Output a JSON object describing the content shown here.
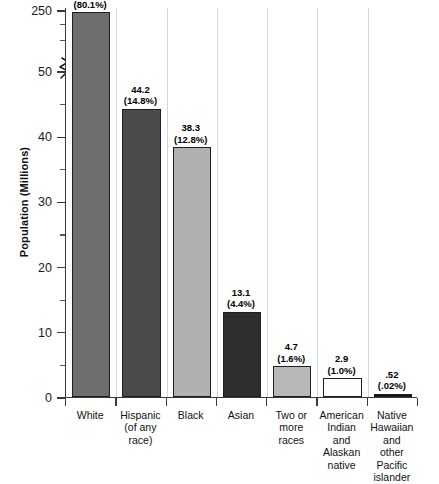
{
  "chart_data": {
    "type": "bar",
    "title": "",
    "xlabel": "",
    "ylabel": "Population (Millions)",
    "ylim": [
      0,
      250
    ],
    "axis_break": {
      "present": true,
      "below": 50,
      "above": 250
    },
    "grid": "vertical category separators only",
    "legend": "none",
    "categories": [
      "White",
      "Hispanic (of any race)",
      "Black",
      "Asian",
      "Two or more races",
      "American Indian and Alaskan native",
      "Native Hawaiian and other Pacific islander"
    ],
    "values": [
      239.9,
      44.2,
      38.3,
      13.1,
      4.7,
      2.9,
      0.52
    ],
    "percents": [
      "80.1%",
      "14.8%",
      "12.8%",
      "4.4%",
      "1.6%",
      "1.0%",
      ".02%"
    ],
    "y_major_ticks": [
      0,
      10,
      20,
      30,
      40,
      50,
      250
    ],
    "y_minor_ticks": [
      5,
      15,
      25,
      35,
      45
    ]
  },
  "axis": {
    "y_title": "Population (Millions)",
    "tick_labels": {
      "t0": "0",
      "t10": "10",
      "t20": "20",
      "t30": "30",
      "t40": "40",
      "t50": "50",
      "t250": "250"
    }
  },
  "bars": [
    {
      "name": "white",
      "value_label": "239.9",
      "percent_label": "(80.1%)",
      "category_line1": "White",
      "category_line2": "",
      "category_line3": "",
      "category_line4": "",
      "category_line5": "",
      "color": "#6e6e6e"
    },
    {
      "name": "hispanic",
      "value_label": "44.2",
      "percent_label": "(14.8%)",
      "category_line1": "Hispanic",
      "category_line2": "(of any race)",
      "category_line3": "",
      "category_line4": "",
      "category_line5": "",
      "color": "#4a4a4a"
    },
    {
      "name": "black",
      "value_label": "38.3",
      "percent_label": "(12.8%)",
      "category_line1": "Black",
      "category_line2": "",
      "category_line3": "",
      "category_line4": "",
      "category_line5": "",
      "color": "#b0b0b0"
    },
    {
      "name": "asian",
      "value_label": "13.1",
      "percent_label": "(4.4%)",
      "category_line1": "Asian",
      "category_line2": "",
      "category_line3": "",
      "category_line4": "",
      "category_line5": "",
      "color": "#2e2e2e"
    },
    {
      "name": "two-or-more-races",
      "value_label": "4.7",
      "percent_label": "(1.6%)",
      "category_line1": "Two or",
      "category_line2": "more",
      "category_line3": "races",
      "category_line4": "",
      "category_line5": "",
      "color": "#b8b8b8"
    },
    {
      "name": "american-indian-alaskan-native",
      "value_label": "2.9",
      "percent_label": "(1.0%)",
      "category_line1": "American",
      "category_line2": "Indian",
      "category_line3": "and",
      "category_line4": "Alaskan",
      "category_line5": "native",
      "color": "#ffffff"
    },
    {
      "name": "native-hawaiian-pacific-islander",
      "value_label": ".52",
      "percent_label": "(.02%)",
      "category_line1": "Native",
      "category_line2": "Hawaiian",
      "category_line3": "and",
      "category_line4": "other",
      "category_line5": "Pacific islander",
      "color": "#111111"
    }
  ],
  "colors": {
    "axis": "#3a3a3a",
    "gridline": "#d6d6d6",
    "text": "#111111",
    "background": "#ffffff"
  }
}
